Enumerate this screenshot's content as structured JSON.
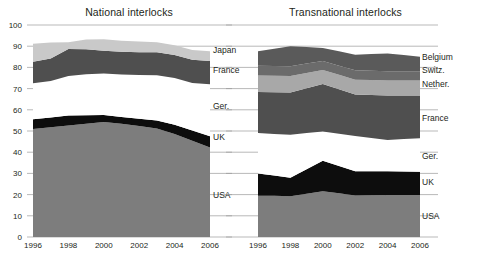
{
  "figure": {
    "background_color": "#ffffff",
    "text_color": "#231f20"
  },
  "panels": [
    {
      "id": "national",
      "title": "National interlocks",
      "series_labels": [
        "USA",
        "UK",
        "Ger.",
        "France",
        "Japan"
      ]
    },
    {
      "id": "transnational",
      "title": "Transnational interlocks",
      "series_labels": [
        "USA",
        "UK",
        "Ger.",
        "France",
        "Nether.",
        "Switz.",
        "Belgium"
      ]
    }
  ],
  "axis": {
    "y_ticks": [
      "0",
      "10",
      "20",
      "30",
      "40",
      "50",
      "60",
      "70",
      "80",
      "90",
      "100"
    ],
    "x_ticks": [
      "1996",
      "1998",
      "2000",
      "2002",
      "2004",
      "2006"
    ]
  },
  "colors": {
    "usa": "#7d7d7d",
    "uk": "#0d0d0d",
    "ger": "#ffffff",
    "france": "#4f4f4f",
    "nether": "#a8a8a8",
    "switz": "#6b6b6b",
    "japan": "#c9c9c9",
    "belgium": "#5a5a5a",
    "grid": "#9b9b9b"
  },
  "chart_data": [
    {
      "type": "area",
      "title": "National interlocks",
      "stacked": true,
      "xlabel": "",
      "ylabel": "",
      "ylim": [
        0,
        100
      ],
      "xlim": [
        1996,
        2006
      ],
      "grid": true,
      "legend_position": "right-inline",
      "x": [
        1996,
        1997,
        1998,
        1999,
        2000,
        2001,
        2002,
        2003,
        2004,
        2005,
        2006
      ],
      "categories": [
        "1996",
        "1998",
        "2000",
        "2002",
        "2004",
        "2006"
      ],
      "series": [
        {
          "name": "USA",
          "color": "#7d7d7d",
          "values": [
            51.0,
            51.8,
            52.6,
            53.4,
            54.2,
            53.4,
            52.4,
            51.2,
            48.6,
            45.4,
            42.2
          ]
        },
        {
          "name": "UK",
          "color": "#0d0d0d",
          "values": [
            4.5,
            4.6,
            4.7,
            4.0,
            3.3,
            3.2,
            3.4,
            3.7,
            4.4,
            4.8,
            5.3
          ]
        },
        {
          "name": "Ger.",
          "color": "#ffffff",
          "values": [
            17.0,
            17.2,
            18.6,
            19.4,
            19.6,
            20.0,
            20.6,
            21.4,
            22.0,
            22.4,
            24.5
          ]
        },
        {
          "name": "France",
          "color": "#4f4f4f",
          "values": [
            10.2,
            10.6,
            12.8,
            11.8,
            10.8,
            10.8,
            10.8,
            10.8,
            10.8,
            11.0,
            11.0
          ]
        },
        {
          "name": "Japan",
          "color": "#c9c9c9",
          "values": [
            8.5,
            7.6,
            3.2,
            4.6,
            5.4,
            5.2,
            5.0,
            4.8,
            4.6,
            4.6,
            4.6
          ]
        }
      ],
      "series_label_y": [
        20,
        47,
        62,
        79,
        88
      ]
    },
    {
      "type": "area",
      "title": "Transnational interlocks",
      "stacked": true,
      "xlabel": "",
      "ylabel": "",
      "ylim": [
        0,
        100
      ],
      "xlim": [
        1996,
        2006
      ],
      "grid": true,
      "legend_position": "right-inline",
      "x": [
        1996,
        1997,
        1998,
        1999,
        2000,
        2001,
        2002,
        2003,
        2004,
        2005,
        2006
      ],
      "categories": [
        "1996",
        "1998",
        "2000",
        "2002",
        "2004",
        "2006"
      ],
      "series": [
        {
          "name": "USA",
          "color": "#7d7d7d",
          "values": [
            19.5,
            19.4,
            19.2,
            20.4,
            21.6,
            20.6,
            19.6,
            19.7,
            19.8,
            19.8,
            19.8
          ]
        },
        {
          "name": "UK",
          "color": "#0d0d0d",
          "values": [
            10.5,
            9.6,
            8.8,
            11.6,
            14.4,
            12.9,
            11.4,
            11.3,
            11.2,
            11.1,
            11.0
          ]
        },
        {
          "name": "Ger.",
          "color": "#ffffff",
          "values": [
            19.0,
            19.6,
            20.2,
            17.0,
            13.8,
            15.2,
            16.6,
            15.7,
            14.8,
            15.3,
            15.8
          ]
        },
        {
          "name": "France",
          "color": "#4f4f4f",
          "values": [
            19.4,
            19.7,
            20.0,
            21.2,
            22.4,
            21.0,
            19.6,
            20.3,
            21.0,
            20.6,
            20.2
          ]
        },
        {
          "name": "Nether.",
          "color": "#a8a8a8",
          "values": [
            7.8,
            7.8,
            7.8,
            7.2,
            6.6,
            6.8,
            7.0,
            7.0,
            7.0,
            7.0,
            7.0
          ]
        },
        {
          "name": "Switz.",
          "color": "#6b6b6b",
          "values": [
            4.6,
            4.6,
            4.6,
            4.4,
            4.2,
            4.3,
            4.4,
            4.4,
            4.4,
            4.4,
            4.4
          ]
        },
        {
          "name": "Belgium",
          "color": "#5a5a5a",
          "values": [
            6.8,
            8.1,
            9.4,
            7.8,
            6.2,
            6.8,
            7.4,
            7.9,
            8.4,
            7.6,
            6.8
          ]
        }
      ],
      "series_label_y": [
        10,
        26,
        38,
        56,
        72,
        79,
        85
      ]
    }
  ]
}
